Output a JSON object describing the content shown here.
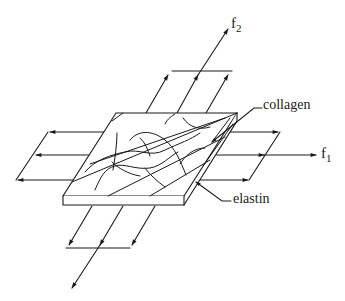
{
  "diagram": {
    "type": "biaxial-loading-schematic",
    "labels": {
      "f2_main": "f",
      "f2_sub": "2",
      "f1_main": "f",
      "f1_sub": "1",
      "collagen": "collagen",
      "elastin": "elastin"
    },
    "forces": [
      {
        "name": "f2",
        "direction": "up-right (out of slab back edge)"
      },
      {
        "name": "f1",
        "direction": "right"
      },
      {
        "name": "f2-opposite",
        "direction": "down-left"
      },
      {
        "name": "f1-opposite",
        "direction": "left"
      }
    ],
    "components": [
      "slab",
      "collagen fibers",
      "elastin fibers"
    ],
    "colors": {
      "stroke": "#1a1a1a",
      "background": "#ffffff"
    }
  }
}
